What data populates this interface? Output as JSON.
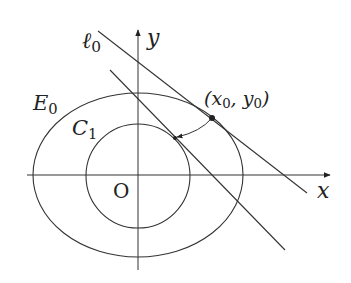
{
  "diagram": {
    "type": "conic-geometry",
    "labels": {
      "line_l0": "ℓ",
      "line_l0_sub": "0",
      "y_axis": "y",
      "x_axis": "x",
      "ellipse": "E",
      "ellipse_sub": "0",
      "circle": "C",
      "circle_sub": "1",
      "point": "(x",
      "point_sub1": "0",
      "point_mid": ", y",
      "point_sub2": "0",
      "point_end": ")",
      "origin": "O"
    },
    "colors": {
      "stroke": "#333333",
      "background": "#ffffff"
    }
  }
}
